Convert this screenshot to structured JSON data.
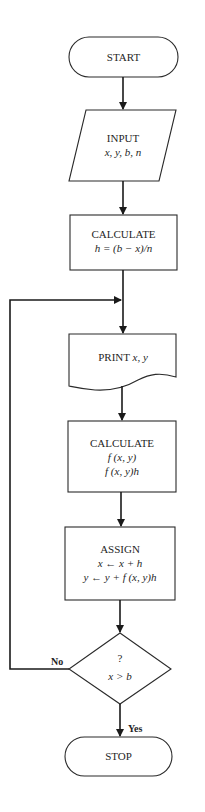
{
  "diagram": {
    "type": "flowchart",
    "nodes": {
      "start": {
        "shape": "terminal",
        "label": "START"
      },
      "input": {
        "shape": "parallelogram",
        "label": "INPUT",
        "detail": "x, y, b, n"
      },
      "calc_h": {
        "shape": "process",
        "label": "CALCULATE",
        "detail": "h = (b − x)/n"
      },
      "print": {
        "shape": "document",
        "label_prefix": "PRINT ",
        "label_vars": "x, y"
      },
      "calc_f": {
        "shape": "process",
        "label": "CALCULATE",
        "detail1": "f (x, y)",
        "detail2": "f (x, y)h"
      },
      "assign": {
        "shape": "process",
        "label": "ASSIGN",
        "detail1": "x ← x + h",
        "detail2": "y ← y + f (x, y)h"
      },
      "decision": {
        "shape": "decision",
        "label": "?",
        "detail": "x > b"
      },
      "stop": {
        "shape": "terminal",
        "label": "STOP"
      }
    },
    "edges": {
      "no_label": "No",
      "yes_label": "Yes"
    },
    "edge_list": [
      {
        "from": "start",
        "to": "input"
      },
      {
        "from": "input",
        "to": "calc_h"
      },
      {
        "from": "calc_h",
        "to": "print"
      },
      {
        "from": "print",
        "to": "calc_f"
      },
      {
        "from": "calc_f",
        "to": "assign"
      },
      {
        "from": "assign",
        "to": "decision"
      },
      {
        "from": "decision",
        "to": "print",
        "label": "No"
      },
      {
        "from": "decision",
        "to": "stop",
        "label": "Yes"
      }
    ]
  }
}
